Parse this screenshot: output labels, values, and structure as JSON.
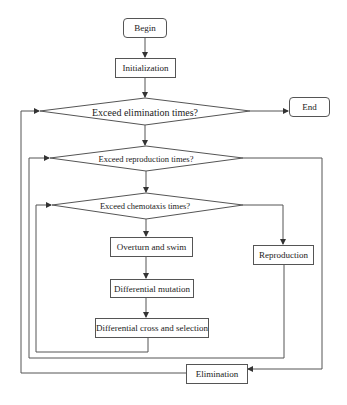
{
  "diagram": {
    "type": "flowchart",
    "nodes": {
      "begin": {
        "label": "Begin",
        "shape": "rounded-rect"
      },
      "initialization": {
        "label": "Initialization",
        "shape": "rect"
      },
      "elimination_check": {
        "label": "Exceed elimination times?",
        "shape": "diamond"
      },
      "end": {
        "label": "End",
        "shape": "rounded-rect"
      },
      "reproduction_check": {
        "label": "Exceed reproduction times?",
        "shape": "diamond"
      },
      "chemotaxis_check": {
        "label": "Exceed chemotaxis times?",
        "shape": "diamond"
      },
      "overturn_swim": {
        "label": "Overturn and swim",
        "shape": "rect"
      },
      "reproduction": {
        "label": "Reproduction",
        "shape": "rect"
      },
      "differential_mutation": {
        "label": "Differential mutation",
        "shape": "rect"
      },
      "differential_cross": {
        "label": "Differential cross and selection",
        "shape": "rect"
      },
      "elimination": {
        "label": "Elimination",
        "shape": "rect"
      }
    },
    "edges": [
      {
        "from": "begin",
        "to": "initialization"
      },
      {
        "from": "initialization",
        "to": "elimination_check"
      },
      {
        "from": "elimination_check",
        "to": "end",
        "branch": "yes"
      },
      {
        "from": "elimination_check",
        "to": "reproduction_check",
        "branch": "no"
      },
      {
        "from": "reproduction_check",
        "to": "elimination",
        "branch": "yes"
      },
      {
        "from": "reproduction_check",
        "to": "chemotaxis_check",
        "branch": "no"
      },
      {
        "from": "chemotaxis_check",
        "to": "reproduction",
        "branch": "yes"
      },
      {
        "from": "chemotaxis_check",
        "to": "overturn_swim",
        "branch": "no"
      },
      {
        "from": "overturn_swim",
        "to": "differential_mutation"
      },
      {
        "from": "differential_mutation",
        "to": "differential_cross"
      },
      {
        "from": "differential_cross",
        "to": "chemotaxis_check",
        "type": "loop"
      },
      {
        "from": "reproduction",
        "to": "reproduction_check",
        "type": "loop"
      },
      {
        "from": "elimination",
        "to": "elimination_check",
        "type": "loop"
      }
    ]
  }
}
